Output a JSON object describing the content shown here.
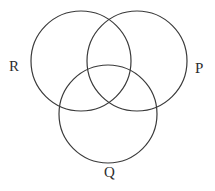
{
  "figure": {
    "type": "venn-diagram",
    "width": 215,
    "height": 191,
    "background_color": "#ffffff",
    "stroke_color": "#3a3a3a",
    "stroke_width": 1.2,
    "label_color": "#2e2e2e",
    "set_count": 3,
    "sets": [
      {
        "id": "R",
        "label": "R",
        "label_position": "left",
        "cx": 81,
        "cy": 61,
        "r": 50
      },
      {
        "id": "P",
        "label": "P",
        "label_position": "right",
        "cx": 137,
        "cy": 61,
        "r": 50
      },
      {
        "id": "Q",
        "label": "Q",
        "label_position": "bottom",
        "cx": 108,
        "cy": 114,
        "r": 49
      }
    ]
  }
}
